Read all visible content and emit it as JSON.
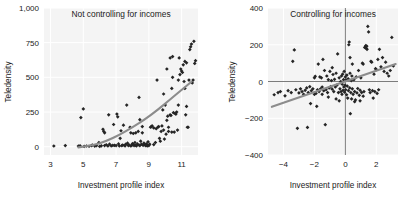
{
  "figure": {
    "width": 405,
    "height": 197,
    "background": "#ffffff",
    "marker_color": "#252525",
    "trend_color": "#8c8c8c",
    "plot_bg": "#f4f4f4",
    "grid_color": "#ffffff"
  },
  "chart_data": [
    {
      "type": "scatter",
      "panel": "left",
      "title": "Not controlling for incomes",
      "xlabel": "Investment profile index",
      "ylabel": "Teledensity",
      "xlim": [
        2.6,
        12.0
      ],
      "ylim": [
        -60,
        1000
      ],
      "xticks": [
        3,
        5,
        7,
        9,
        11
      ],
      "xtick_labels": [
        "3",
        "5",
        "7",
        "9",
        "11"
      ],
      "yticks": [
        0,
        250,
        500,
        750,
        1000
      ],
      "ytick_labels": [
        "0",
        "250",
        "500",
        "750",
        "1,000"
      ],
      "grid": true,
      "legend": "none",
      "trend": {
        "type": "curve",
        "points": [
          [
            4.7,
            -5
          ],
          [
            5.6,
            10
          ],
          [
            6.4,
            40
          ],
          [
            7.2,
            85
          ],
          [
            8.0,
            140
          ],
          [
            8.8,
            200
          ],
          [
            9.5,
            262
          ],
          [
            10.2,
            330
          ],
          [
            10.9,
            400
          ],
          [
            11.6,
            468
          ]
        ]
      },
      "points": [
        [
          3.2,
          5
        ],
        [
          3.9,
          8
        ],
        [
          4.7,
          4
        ],
        [
          4.8,
          6
        ],
        [
          4.85,
          210
        ],
        [
          5.0,
          272
        ],
        [
          5.05,
          2
        ],
        [
          5.2,
          5
        ],
        [
          5.35,
          3
        ],
        [
          5.5,
          8
        ],
        [
          5.55,
          12
        ],
        [
          5.7,
          4
        ],
        [
          5.8,
          7
        ],
        [
          5.95,
          30
        ],
        [
          6.0,
          2
        ],
        [
          6.1,
          6
        ],
        [
          6.2,
          125
        ],
        [
          6.25,
          110
        ],
        [
          6.3,
          8
        ],
        [
          6.4,
          14
        ],
        [
          6.5,
          5
        ],
        [
          6.55,
          230
        ],
        [
          6.6,
          18
        ],
        [
          6.7,
          6
        ],
        [
          6.8,
          9
        ],
        [
          6.85,
          160
        ],
        [
          6.9,
          10
        ],
        [
          7.0,
          8
        ],
        [
          7.05,
          235
        ],
        [
          7.1,
          215
        ],
        [
          7.15,
          20
        ],
        [
          7.2,
          5
        ],
        [
          7.25,
          60
        ],
        [
          7.3,
          115
        ],
        [
          7.35,
          7
        ],
        [
          7.4,
          12
        ],
        [
          7.45,
          155
        ],
        [
          7.5,
          10
        ],
        [
          7.55,
          6
        ],
        [
          7.6,
          18
        ],
        [
          7.65,
          300
        ],
        [
          7.7,
          25
        ],
        [
          7.75,
          8
        ],
        [
          7.8,
          12
        ],
        [
          7.85,
          140
        ],
        [
          7.9,
          5
        ],
        [
          7.95,
          9
        ],
        [
          8.0,
          22
        ],
        [
          8.05,
          15
        ],
        [
          8.1,
          8
        ],
        [
          8.15,
          30
        ],
        [
          8.2,
          10
        ],
        [
          8.25,
          6
        ],
        [
          8.3,
          20
        ],
        [
          8.35,
          110
        ],
        [
          8.4,
          12
        ],
        [
          8.45,
          8
        ],
        [
          8.5,
          40
        ],
        [
          8.55,
          18
        ],
        [
          8.6,
          145
        ],
        [
          8.65,
          10
        ],
        [
          8.7,
          25
        ],
        [
          8.75,
          15
        ],
        [
          8.8,
          8
        ],
        [
          8.85,
          20
        ],
        [
          8.9,
          5
        ],
        [
          8.95,
          35
        ],
        [
          8.4,
          355
        ],
        [
          8.45,
          195
        ],
        [
          8.6,
          100
        ],
        [
          8.9,
          12
        ],
        [
          9.0,
          8
        ],
        [
          9.05,
          18
        ],
        [
          9.1,
          140
        ],
        [
          9.15,
          145
        ],
        [
          9.2,
          150
        ],
        [
          9.3,
          15
        ],
        [
          9.4,
          30
        ],
        [
          9.5,
          480
        ],
        [
          9.55,
          140
        ],
        [
          9.6,
          145
        ],
        [
          9.65,
          60
        ],
        [
          9.7,
          40
        ],
        [
          9.75,
          110
        ],
        [
          9.8,
          150
        ],
        [
          9.85,
          265
        ],
        [
          9.9,
          120
        ],
        [
          9.95,
          55
        ],
        [
          10.0,
          300
        ],
        [
          10.05,
          90
        ],
        [
          10.1,
          190
        ],
        [
          10.15,
          220
        ],
        [
          10.2,
          140
        ],
        [
          10.3,
          230
        ],
        [
          10.35,
          225
        ],
        [
          10.4,
          420
        ],
        [
          10.45,
          500
        ],
        [
          10.5,
          245
        ],
        [
          10.55,
          105
        ],
        [
          10.6,
          240
        ],
        [
          10.65,
          235
        ],
        [
          10.7,
          250
        ],
        [
          10.75,
          120
        ],
        [
          10.8,
          480
        ],
        [
          10.85,
          640
        ],
        [
          10.9,
          520
        ],
        [
          10.95,
          560
        ],
        [
          11.0,
          545
        ],
        [
          11.05,
          535
        ],
        [
          11.1,
          590
        ],
        [
          11.15,
          470
        ],
        [
          11.2,
          420
        ],
        [
          11.25,
          230
        ],
        [
          11.3,
          290
        ],
        [
          11.35,
          140
        ],
        [
          11.4,
          140
        ],
        [
          11.45,
          480
        ],
        [
          11.5,
          700
        ],
        [
          11.55,
          720
        ],
        [
          11.6,
          740
        ],
        [
          11.65,
          460
        ],
        [
          11.7,
          480
        ],
        [
          11.75,
          760
        ],
        [
          11.8,
          600
        ],
        [
          11.85,
          620
        ],
        [
          10.3,
          640
        ],
        [
          10.45,
          650
        ],
        [
          9.9,
          380
        ],
        [
          10.1,
          560
        ],
        [
          11.2,
          615
        ],
        [
          11.3,
          605
        ],
        [
          10.8,
          300
        ],
        [
          10.2,
          110
        ],
        [
          10.4,
          105
        ],
        [
          9.3,
          135
        ],
        [
          9.45,
          130
        ],
        [
          8.2,
          100
        ],
        [
          8.05,
          95
        ],
        [
          7.9,
          100
        ],
        [
          6.3,
          100
        ]
      ]
    },
    {
      "type": "scatter",
      "panel": "right",
      "title": "Controlling for incomes",
      "xlabel": "Investment profile index",
      "ylabel": "Teledensity",
      "xlim": [
        -5.0,
        3.4
      ],
      "ylim": [
        -400,
        400
      ],
      "xticks": [
        -4,
        -2,
        0,
        2
      ],
      "xtick_labels": [
        "−4",
        "−2",
        "0",
        "2"
      ],
      "yticks": [
        -400,
        -200,
        0,
        200,
        400
      ],
      "ytick_labels": [
        "−400",
        "−200",
        "0",
        "200",
        "400"
      ],
      "grid": true,
      "legend": "none",
      "zero_lines": true,
      "trend": {
        "type": "line",
        "points": [
          [
            -4.75,
            -138
          ],
          [
            3.25,
            95
          ]
        ]
      },
      "points": [
        [
          -4.6,
          -72
        ],
        [
          -4.2,
          -55
        ],
        [
          -3.9,
          -78
        ],
        [
          -3.7,
          -50
        ],
        [
          -3.5,
          -60
        ],
        [
          -3.4,
          110
        ],
        [
          -3.3,
          172
        ],
        [
          -3.2,
          -45
        ],
        [
          -3.1,
          -255
        ],
        [
          -3.0,
          -62
        ],
        [
          -2.9,
          -40
        ],
        [
          -2.8,
          -55
        ],
        [
          -2.7,
          -70
        ],
        [
          -2.6,
          -48
        ],
        [
          -2.5,
          -35
        ],
        [
          -2.45,
          -250
        ],
        [
          -2.4,
          -60
        ],
        [
          -2.3,
          -28
        ],
        [
          -2.25,
          -120
        ],
        [
          -2.2,
          -50
        ],
        [
          -2.1,
          -40
        ],
        [
          -2.0,
          20
        ],
        [
          -1.95,
          28
        ],
        [
          -1.9,
          -65
        ],
        [
          -1.85,
          -135
        ],
        [
          -1.8,
          -45
        ],
        [
          -1.75,
          95
        ],
        [
          -1.7,
          -55
        ],
        [
          -1.65,
          25
        ],
        [
          -1.6,
          -40
        ],
        [
          -1.55,
          20
        ],
        [
          -1.5,
          -30
        ],
        [
          -1.45,
          120
        ],
        [
          -1.4,
          -50
        ],
        [
          -1.35,
          60
        ],
        [
          -1.3,
          -235
        ],
        [
          -1.25,
          -45
        ],
        [
          -1.2,
          30
        ],
        [
          -1.15,
          -60
        ],
        [
          -1.1,
          10
        ],
        [
          -1.05,
          -35
        ],
        [
          -1.0,
          55
        ],
        [
          -0.95,
          -28
        ],
        [
          -0.9,
          5
        ],
        [
          -0.85,
          -42
        ],
        [
          -0.8,
          38
        ],
        [
          -0.75,
          -55
        ],
        [
          -0.7,
          12
        ],
        [
          -0.65,
          -30
        ],
        [
          -0.6,
          45
        ],
        [
          -0.55,
          -20
        ],
        [
          -0.5,
          150
        ],
        [
          -0.45,
          -60
        ],
        [
          -0.4,
          20
        ],
        [
          -0.35,
          -40
        ],
        [
          -0.3,
          0
        ],
        [
          -0.28,
          -55
        ],
        [
          -0.25,
          30
        ],
        [
          -0.22,
          -70
        ],
        [
          -0.2,
          -15
        ],
        [
          -0.18,
          40
        ],
        [
          -0.15,
          -48
        ],
        [
          -0.12,
          10
        ],
        [
          -0.1,
          -30
        ],
        [
          -0.08,
          55
        ],
        [
          -0.05,
          -58
        ],
        [
          -0.02,
          -20
        ],
        [
          0.0,
          25
        ],
        [
          0.02,
          -45
        ],
        [
          0.05,
          8
        ],
        [
          0.08,
          -72
        ],
        [
          0.1,
          35
        ],
        [
          0.12,
          -25
        ],
        [
          0.15,
          -90
        ],
        [
          0.18,
          15
        ],
        [
          0.2,
          -50
        ],
        [
          0.22,
          200
        ],
        [
          0.25,
          215
        ],
        [
          0.28,
          -35
        ],
        [
          0.3,
          45
        ],
        [
          0.32,
          -175
        ],
        [
          0.35,
          -60
        ],
        [
          0.38,
          5
        ],
        [
          0.4,
          -95
        ],
        [
          0.42,
          30
        ],
        [
          0.45,
          -40
        ],
        [
          0.5,
          -70
        ],
        [
          0.55,
          10
        ],
        [
          0.6,
          -55
        ],
        [
          0.65,
          -100
        ],
        [
          0.7,
          25
        ],
        [
          0.75,
          -62
        ],
        [
          0.8,
          -38
        ],
        [
          0.85,
          60
        ],
        [
          0.9,
          -75
        ],
        [
          0.95,
          -48
        ],
        [
          1.0,
          20
        ],
        [
          1.05,
          -60
        ],
        [
          1.1,
          100
        ],
        [
          1.15,
          95
        ],
        [
          1.2,
          -55
        ],
        [
          1.25,
          185
        ],
        [
          1.3,
          190
        ],
        [
          1.32,
          195
        ],
        [
          1.35,
          180
        ],
        [
          1.38,
          192
        ],
        [
          1.4,
          175
        ],
        [
          1.45,
          300
        ],
        [
          1.5,
          270
        ],
        [
          1.55,
          -45
        ],
        [
          1.6,
          -60
        ],
        [
          1.65,
          110
        ],
        [
          1.7,
          105
        ],
        [
          1.75,
          -50
        ],
        [
          1.8,
          -90
        ],
        [
          1.85,
          40
        ],
        [
          1.9,
          -55
        ],
        [
          1.95,
          70
        ],
        [
          2.0,
          65
        ],
        [
          2.05,
          -65
        ],
        [
          2.1,
          120
        ],
        [
          2.15,
          -45
        ],
        [
          2.2,
          175
        ],
        [
          2.3,
          80
        ],
        [
          2.4,
          130
        ],
        [
          2.5,
          55
        ],
        [
          2.6,
          105
        ],
        [
          2.7,
          45
        ],
        [
          2.8,
          30
        ],
        [
          2.9,
          60
        ],
        [
          3.0,
          240
        ],
        [
          3.1,
          85
        ],
        [
          0.95,
          -105
        ],
        [
          1.15,
          -80
        ],
        [
          0.6,
          -110
        ],
        [
          -0.4,
          -105
        ],
        [
          -0.6,
          -95
        ],
        [
          -1.1,
          -85
        ],
        [
          -1.5,
          -70
        ],
        [
          -2.0,
          -70
        ],
        [
          -4.35,
          -60
        ],
        [
          0.3,
          130
        ],
        [
          0.45,
          95
        ],
        [
          -0.85,
          75
        ]
      ]
    }
  ]
}
